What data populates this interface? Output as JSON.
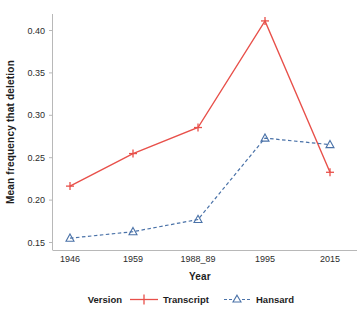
{
  "chart_data": {
    "type": "line",
    "title": "",
    "subtitle": "",
    "xlabel": "Year",
    "ylabel": "Mean frequency that deletion",
    "categories": [
      "1946",
      "1959",
      "1988_89",
      "1995",
      "2015"
    ],
    "x_tick_labels": [
      "1946",
      "1959",
      "1988_89",
      "1995",
      "2015"
    ],
    "y_tick_labels": [
      "0.15",
      "0.20",
      "0.25",
      "0.30",
      "0.35",
      "0.40"
    ],
    "y_tick_values": [
      0.15,
      0.2,
      0.25,
      0.3,
      0.35,
      0.4
    ],
    "ylim": [
      0.1325,
      0.4225
    ],
    "grid": false,
    "legend_position": "bottom",
    "legend_title": "Version",
    "series": [
      {
        "name": "Transcript",
        "color": "#e8504a",
        "line_style": "solid",
        "marker": "plus",
        "values": [
          0.211,
          0.251,
          0.283,
          0.414,
          0.228
        ]
      },
      {
        "name": "Hansard",
        "color": "#4a72a8",
        "line_style": "dashed",
        "marker": "triangle-open",
        "values": [
          0.147,
          0.155,
          0.17,
          0.27,
          0.262
        ]
      }
    ]
  },
  "axes": {
    "x_axis_title": "Year",
    "y_axis_title": "Mean frequency that deletion"
  },
  "legend": {
    "title": "Version",
    "entries": [
      {
        "label": "Transcript",
        "color": "#e8504a",
        "marker": "plus",
        "style": "solid"
      },
      {
        "label": "Hansard",
        "color": "#4a72a8",
        "marker": "triangle-open",
        "style": "dashed"
      }
    ]
  }
}
